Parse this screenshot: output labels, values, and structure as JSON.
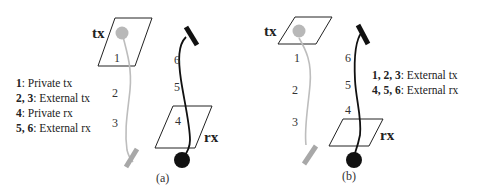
{
  "panels": [
    {
      "id": "a",
      "caption": "(a)",
      "tx_label": "tx",
      "rx_label": "rx",
      "tx_segment_numbers": [
        "1",
        "2",
        "3"
      ],
      "rx_segment_numbers": [
        "4",
        "5",
        "6"
      ],
      "legend": [
        {
          "keys": "1",
          "text": ": Private tx"
        },
        {
          "keys": "2, 3",
          "text": ": External tx"
        },
        {
          "keys": "4",
          "text": ": Private rx"
        },
        {
          "keys": "5, 6",
          "text": ": External rx"
        }
      ]
    },
    {
      "id": "b",
      "caption": "(b)",
      "tx_label": "tx",
      "rx_label": "rx",
      "tx_segment_numbers": [
        "1",
        "2",
        "3"
      ],
      "rx_segment_numbers": [
        "4",
        "5",
        "6"
      ],
      "legend": [
        {
          "keys": "1, 2, 3",
          "text": ": External tx"
        },
        {
          "keys": "4, 5, 6",
          "text": ": External rx"
        }
      ]
    }
  ],
  "colors": {
    "tx_path": "#b4b4b4",
    "rx_path": "#111111",
    "plane_outline": "#222222"
  }
}
